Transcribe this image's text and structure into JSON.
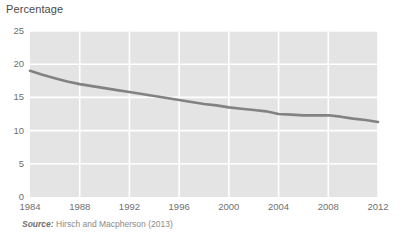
{
  "chart_data": {
    "type": "line",
    "title": "",
    "ylabel": "Percentage",
    "xlabel": "",
    "xlim": [
      1984,
      2012
    ],
    "ylim": [
      0,
      25
    ],
    "grid": true,
    "legend": "none",
    "series_color": "#828282",
    "plot_background": "#e4e4e4",
    "gridline_color": "#ffffff",
    "ytick_labels": [
      "25",
      "20",
      "15",
      "10",
      "5",
      "0"
    ],
    "ytick_values": [
      25,
      20,
      15,
      10,
      5,
      0
    ],
    "xtick_labels": [
      "1984",
      "1988",
      "1992",
      "1996",
      "2000",
      "2004",
      "2008",
      "2012"
    ],
    "xtick_values": [
      1984,
      1988,
      1992,
      1996,
      2000,
      2004,
      2008,
      2012
    ],
    "x": [
      1984,
      1985,
      1986,
      1987,
      1988,
      1989,
      1990,
      1991,
      1992,
      1993,
      1994,
      1995,
      1996,
      1997,
      1998,
      1999,
      2000,
      2001,
      2002,
      2003,
      2004,
      2005,
      2006,
      2007,
      2008,
      2009,
      2010,
      2011,
      2012
    ],
    "values": [
      19.0,
      18.4,
      17.9,
      17.4,
      17.0,
      16.7,
      16.4,
      16.1,
      15.8,
      15.5,
      15.2,
      14.9,
      14.6,
      14.3,
      14.0,
      13.8,
      13.5,
      13.3,
      13.1,
      12.9,
      12.5,
      12.4,
      12.3,
      12.3,
      12.3,
      12.1,
      11.8,
      11.6,
      11.3
    ]
  },
  "source": {
    "label": "Source:",
    "text": " Hirsch and Macpherson (2013)"
  }
}
